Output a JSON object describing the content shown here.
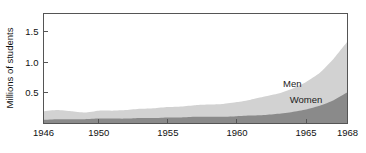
{
  "chart_data": {
    "type": "area",
    "stacked": true,
    "title": "",
    "subtitle": "",
    "xlabel": "",
    "ylabel": "Millions of students",
    "xlim": [
      1946,
      1968
    ],
    "ylim": [
      0,
      1.8
    ],
    "grid": false,
    "legend_position": "inline-annotation",
    "x_tick_labels": [
      "1946",
      "1950",
      "1955",
      "1960",
      "1965",
      "1968"
    ],
    "x_tick_values": [
      1946,
      1950,
      1955,
      1960,
      1965,
      1968
    ],
    "y_tick_labels": [
      "0.5",
      "1.0",
      "1.5"
    ],
    "y_tick_values": [
      0.5,
      1.0,
      1.5
    ],
    "x": [
      1946,
      1947,
      1948,
      1949,
      1950,
      1951,
      1952,
      1953,
      1954,
      1955,
      1956,
      1957,
      1958,
      1959,
      1960,
      1961,
      1962,
      1963,
      1964,
      1965,
      1966,
      1967,
      1968
    ],
    "series": [
      {
        "name": "Women",
        "color": "#8a8a8a",
        "values": [
          0.06,
          0.07,
          0.07,
          0.07,
          0.08,
          0.08,
          0.08,
          0.09,
          0.09,
          0.1,
          0.1,
          0.11,
          0.11,
          0.11,
          0.12,
          0.13,
          0.14,
          0.16,
          0.19,
          0.23,
          0.29,
          0.38,
          0.51
        ]
      },
      {
        "name": "Men",
        "color": "#d2d2d2",
        "values": [
          0.14,
          0.15,
          0.13,
          0.11,
          0.13,
          0.13,
          0.14,
          0.15,
          0.16,
          0.17,
          0.18,
          0.19,
          0.2,
          0.21,
          0.23,
          0.26,
          0.3,
          0.33,
          0.38,
          0.45,
          0.54,
          0.68,
          0.83
        ]
      }
    ],
    "totals": [
      0.2,
      0.22,
      0.2,
      0.18,
      0.21,
      0.21,
      0.22,
      0.24,
      0.25,
      0.27,
      0.28,
      0.3,
      0.31,
      0.32,
      0.35,
      0.39,
      0.44,
      0.49,
      0.57,
      0.68,
      0.83,
      1.06,
      1.34
    ],
    "annotations": [
      {
        "text": "Men",
        "x": 1964,
        "y": 0.6
      },
      {
        "text": "Women",
        "x": 1965,
        "y": 0.33
      }
    ]
  },
  "colors": {
    "background": "#ffffff",
    "frame": "#555555",
    "men_band": "#d2d2d2",
    "women_band": "#8a8a8a",
    "text": "#111111"
  }
}
